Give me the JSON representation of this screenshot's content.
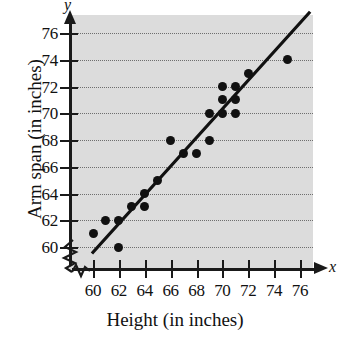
{
  "chart_data": {
    "type": "scatter",
    "title": "",
    "xlabel": "Height (in inches)",
    "ylabel": "Arm span (in inches)",
    "x_var": "x",
    "y_var": "y",
    "xlim": [
      59,
      77
    ],
    "ylim": [
      59,
      77.5
    ],
    "xticks": [
      60,
      62,
      64,
      66,
      68,
      70,
      72,
      74,
      76
    ],
    "yticks": [
      60,
      62,
      64,
      66,
      68,
      70,
      72,
      74,
      76
    ],
    "xticklabels": [
      "60",
      "62",
      "64",
      "66",
      "68",
      "70",
      "72",
      "74",
      "76"
    ],
    "yticklabels": [
      "60",
      "62",
      "64",
      "66",
      "68",
      "70",
      "72",
      "74",
      "76"
    ],
    "grid": "horizontal-dotted",
    "legend": "none",
    "axis_break_x": true,
    "axis_break_y": true,
    "plot_background": "#dcdcdc",
    "marker_color": "#111111",
    "line_color": "#111111",
    "points": [
      {
        "x": 60,
        "y": 61
      },
      {
        "x": 61,
        "y": 62
      },
      {
        "x": 62,
        "y": 62
      },
      {
        "x": 62,
        "y": 60
      },
      {
        "x": 63,
        "y": 63
      },
      {
        "x": 64,
        "y": 63
      },
      {
        "x": 64,
        "y": 64
      },
      {
        "x": 65,
        "y": 65
      },
      {
        "x": 66,
        "y": 68
      },
      {
        "x": 67,
        "y": 67
      },
      {
        "x": 68,
        "y": 67
      },
      {
        "x": 69,
        "y": 70
      },
      {
        "x": 69,
        "y": 68
      },
      {
        "x": 70,
        "y": 72
      },
      {
        "x": 70,
        "y": 71
      },
      {
        "x": 70,
        "y": 70
      },
      {
        "x": 71,
        "y": 72
      },
      {
        "x": 71,
        "y": 71
      },
      {
        "x": 71,
        "y": 70
      },
      {
        "x": 72,
        "y": 73
      },
      {
        "x": 75,
        "y": 74
      }
    ],
    "trend_line": {
      "x1": 60.0,
      "y1": 59.6,
      "x2": 76.7,
      "y2": 77.5
    }
  }
}
